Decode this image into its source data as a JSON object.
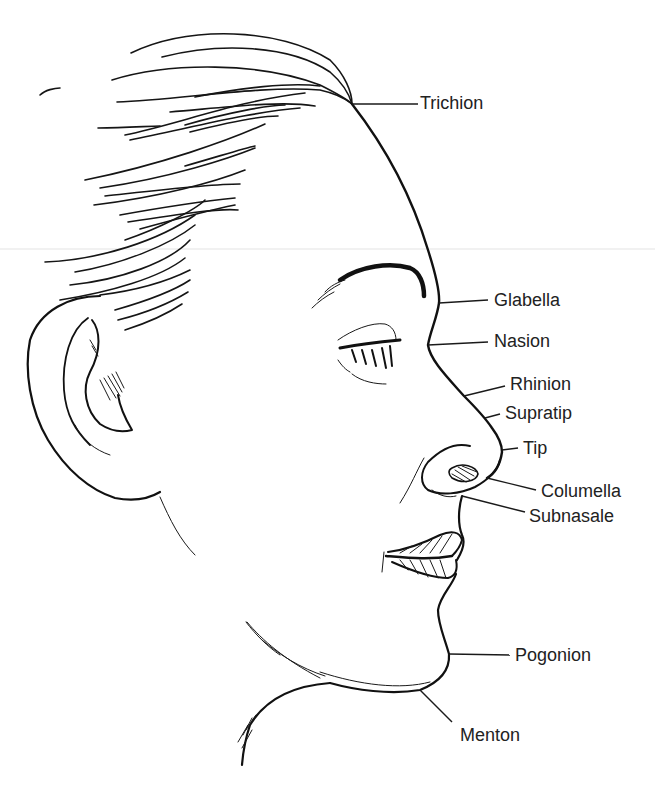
{
  "figure": {
    "ink_color": "#111111",
    "background": "#ffffff"
  },
  "landmarks": [
    {
      "id": "trichion",
      "label": "Trichion",
      "point": [
        352,
        104
      ],
      "label_pos": [
        420,
        94
      ]
    },
    {
      "id": "glabella",
      "label": "Glabella",
      "point": [
        439,
        303
      ],
      "label_pos": [
        494,
        291
      ]
    },
    {
      "id": "nasion",
      "label": "Nasion",
      "point": [
        428,
        345
      ],
      "label_pos": [
        494,
        332
      ]
    },
    {
      "id": "rhinion",
      "label": "Rhinion",
      "point": [
        464,
        396
      ],
      "label_pos": [
        510,
        375
      ]
    },
    {
      "id": "supratip",
      "label": "Supratip",
      "point": [
        485,
        418
      ],
      "label_pos": [
        505,
        404
      ]
    },
    {
      "id": "tip",
      "label": "Tip",
      "point": [
        502,
        450
      ],
      "label_pos": [
        523,
        439
      ]
    },
    {
      "id": "columella",
      "label": "Columella",
      "point": [
        487,
        478
      ],
      "label_pos": [
        541,
        482
      ]
    },
    {
      "id": "subnasale",
      "label": "Subnasale",
      "point": [
        462,
        496
      ],
      "label_pos": [
        529,
        507
      ]
    },
    {
      "id": "pogonion",
      "label": "Pogonion",
      "point": [
        449,
        654
      ],
      "label_pos": [
        515,
        646
      ]
    },
    {
      "id": "menton",
      "label": "Menton",
      "point": [
        420,
        690
      ],
      "label_pos": [
        460,
        726
      ]
    }
  ]
}
